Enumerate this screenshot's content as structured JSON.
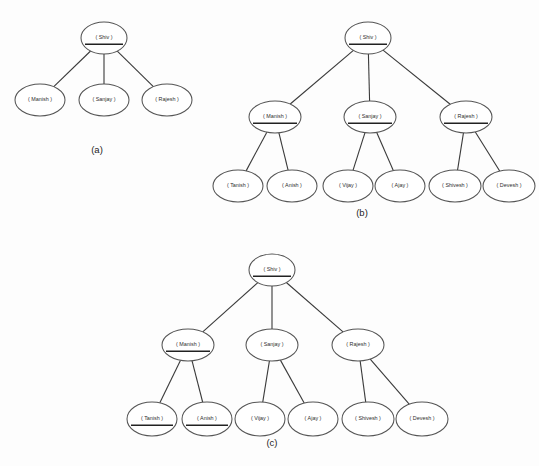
{
  "figure": {
    "background_color": "#fdfdfd",
    "node_fill": "#ffffff",
    "node_stroke": "#555555",
    "edge_color": "#3a3a3a",
    "text_color": "#2e2e2e",
    "underline_color": "#222222"
  },
  "diagrams": [
    {
      "id": "a",
      "caption": "(a)",
      "caption_x": 97,
      "caption_y": 150,
      "nodes": [
        {
          "key": "a-shiv",
          "label": "( Shiv )",
          "cx": 104,
          "cy": 38,
          "rx": 23,
          "ry": 16,
          "underlined": true,
          "font_size": 5.4
        },
        {
          "key": "a-manish",
          "label": "( Manish )",
          "cx": 40,
          "cy": 100,
          "rx": 25,
          "ry": 16,
          "underlined": false,
          "font_size": 5.4
        },
        {
          "key": "a-sanjay",
          "label": "( Sanjay )",
          "cx": 104,
          "cy": 100,
          "rx": 25,
          "ry": 16,
          "underlined": false,
          "font_size": 5.4
        },
        {
          "key": "a-rajesh",
          "label": "( Rajesh )",
          "cx": 167,
          "cy": 100,
          "rx": 25,
          "ry": 16,
          "underlined": false,
          "font_size": 5.4
        }
      ],
      "edges": [
        {
          "from": "a-shiv",
          "to": "a-manish"
        },
        {
          "from": "a-shiv",
          "to": "a-sanjay"
        },
        {
          "from": "a-shiv",
          "to": "a-rajesh"
        }
      ]
    },
    {
      "id": "b",
      "caption": "(b)",
      "caption_y": 213,
      "caption_x": 362,
      "nodes": [
        {
          "key": "b-shiv",
          "label": "( Shiv )",
          "cx": 368,
          "cy": 38,
          "rx": 23,
          "ry": 16,
          "underlined": true,
          "font_size": 5.4
        },
        {
          "key": "b-manish",
          "label": "( Manish )",
          "cx": 275,
          "cy": 117,
          "rx": 26,
          "ry": 16,
          "underlined": true,
          "font_size": 5.4
        },
        {
          "key": "b-sanjay",
          "label": "( Sanjay )",
          "cx": 370,
          "cy": 117,
          "rx": 26,
          "ry": 16,
          "underlined": true,
          "font_size": 5.4
        },
        {
          "key": "b-rajesh",
          "label": "( Rajesh )",
          "cx": 466,
          "cy": 117,
          "rx": 26,
          "ry": 16,
          "underlined": true,
          "font_size": 5.4
        },
        {
          "key": "b-tanish",
          "label": "( Tanish )",
          "cx": 238,
          "cy": 186,
          "rx": 25,
          "ry": 16,
          "underlined": false,
          "font_size": 5.4
        },
        {
          "key": "b-anish",
          "label": "( Anish )",
          "cx": 292,
          "cy": 186,
          "rx": 25,
          "ry": 16,
          "underlined": false,
          "font_size": 5.4
        },
        {
          "key": "b-vijay",
          "label": "( Vijay )",
          "cx": 348,
          "cy": 186,
          "rx": 25,
          "ry": 16,
          "underlined": false,
          "font_size": 5.4
        },
        {
          "key": "b-ajay",
          "label": "( Ajay )",
          "cx": 400,
          "cy": 186,
          "rx": 25,
          "ry": 16,
          "underlined": false,
          "font_size": 5.4
        },
        {
          "key": "b-shivesh",
          "label": "( Shivesh )",
          "cx": 455,
          "cy": 186,
          "rx": 26,
          "ry": 16,
          "underlined": false,
          "font_size": 5.4
        },
        {
          "key": "b-devesh",
          "label": "( Devesh )",
          "cx": 509,
          "cy": 186,
          "rx": 26,
          "ry": 16,
          "underlined": false,
          "font_size": 5.4
        }
      ],
      "edges": [
        {
          "from": "b-shiv",
          "to": "b-manish"
        },
        {
          "from": "b-shiv",
          "to": "b-sanjay"
        },
        {
          "from": "b-shiv",
          "to": "b-rajesh"
        },
        {
          "from": "b-manish",
          "to": "b-tanish"
        },
        {
          "from": "b-manish",
          "to": "b-anish"
        },
        {
          "from": "b-sanjay",
          "to": "b-vijay"
        },
        {
          "from": "b-sanjay",
          "to": "b-ajay"
        },
        {
          "from": "b-rajesh",
          "to": "b-shivesh"
        },
        {
          "from": "b-rajesh",
          "to": "b-devesh"
        }
      ]
    },
    {
      "id": "c",
      "caption": "(c)",
      "caption_x": 272,
      "caption_y": 443,
      "nodes": [
        {
          "key": "c-shiv",
          "label": "( Shiv )",
          "cx": 272,
          "cy": 270,
          "rx": 23,
          "ry": 16,
          "underlined": true,
          "font_size": 5.4
        },
        {
          "key": "c-manish",
          "label": "( Manish )",
          "cx": 188,
          "cy": 345,
          "rx": 26,
          "ry": 16,
          "underlined": true,
          "font_size": 5.4
        },
        {
          "key": "c-sanjay",
          "label": "( Sanjay )",
          "cx": 272,
          "cy": 345,
          "rx": 26,
          "ry": 16,
          "underlined": false,
          "font_size": 5.4
        },
        {
          "key": "c-rajesh",
          "label": "( Rajesh )",
          "cx": 358,
          "cy": 345,
          "rx": 26,
          "ry": 16,
          "underlined": false,
          "font_size": 5.4
        },
        {
          "key": "c-tanish",
          "label": "( Tanish )",
          "cx": 152,
          "cy": 419,
          "rx": 25,
          "ry": 17,
          "underlined": true,
          "font_size": 5.4
        },
        {
          "key": "c-anish",
          "label": "( Anish )",
          "cx": 207,
          "cy": 419,
          "rx": 25,
          "ry": 17,
          "underlined": true,
          "font_size": 5.4
        },
        {
          "key": "c-vijay",
          "label": "( Vijay )",
          "cx": 260,
          "cy": 419,
          "rx": 25,
          "ry": 17,
          "underlined": false,
          "font_size": 5.4
        },
        {
          "key": "c-ajay",
          "label": "( Ajay )",
          "cx": 313,
          "cy": 419,
          "rx": 25,
          "ry": 17,
          "underlined": false,
          "font_size": 5.4
        },
        {
          "key": "c-shivesh",
          "label": "( Shivesh )",
          "cx": 368,
          "cy": 419,
          "rx": 26,
          "ry": 17,
          "underlined": false,
          "font_size": 5.4
        },
        {
          "key": "c-devesh",
          "label": "( Devesh )",
          "cx": 422,
          "cy": 419,
          "rx": 26,
          "ry": 17,
          "underlined": false,
          "font_size": 5.4
        }
      ],
      "edges": [
        {
          "from": "c-shiv",
          "to": "c-manish"
        },
        {
          "from": "c-shiv",
          "to": "c-sanjay"
        },
        {
          "from": "c-shiv",
          "to": "c-rajesh"
        },
        {
          "from": "c-manish",
          "to": "c-tanish"
        },
        {
          "from": "c-manish",
          "to": "c-anish"
        },
        {
          "from": "c-sanjay",
          "to": "c-vijay"
        },
        {
          "from": "c-sanjay",
          "to": "c-ajay"
        },
        {
          "from": "c-rajesh",
          "to": "c-shivesh"
        },
        {
          "from": "c-rajesh",
          "to": "c-devesh"
        }
      ]
    }
  ]
}
